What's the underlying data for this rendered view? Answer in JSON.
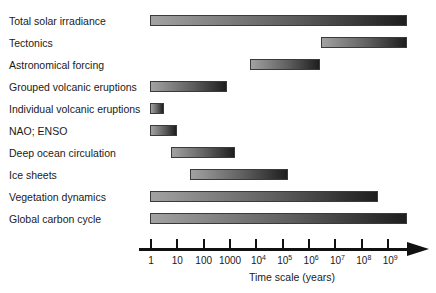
{
  "chart_data": {
    "type": "bar",
    "subtype": "horizontal range (Gantt-style) on log time axis",
    "title": "",
    "xlabel": "Time scale (years)",
    "ylabel": "",
    "x_scale": "log10",
    "xlim_log10": [
      0,
      9.7
    ],
    "grid": false,
    "legend": null,
    "x_ticks": [
      {
        "base": "1",
        "exp": ""
      },
      {
        "base": "10",
        "exp": ""
      },
      {
        "base": "100",
        "exp": ""
      },
      {
        "base": "1000",
        "exp": ""
      },
      {
        "base": "10",
        "exp": "4"
      },
      {
        "base": "10",
        "exp": "5"
      },
      {
        "base": "10",
        "exp": "6"
      },
      {
        "base": "10",
        "exp": "7"
      },
      {
        "base": "10",
        "exp": "8"
      },
      {
        "base": "10",
        "exp": "9"
      }
    ],
    "categories": [
      "Total solar irradiance",
      "Tectonics",
      "Astronomical forcing",
      "Grouped volcanic eruptions",
      "Individual volcanic eruptions",
      "NAO; ENSO",
      "Deep ocean circulation",
      "Ice sheets",
      "Vegetation dynamics",
      "Global carbon cycle"
    ],
    "ranges_log10_years": [
      {
        "start": 0.0,
        "end": 9.7
      },
      {
        "start": 6.5,
        "end": 9.7
      },
      {
        "start": 3.8,
        "end": 6.4
      },
      {
        "start": 0.0,
        "end": 2.9
      },
      {
        "start": 0.0,
        "end": 0.5
      },
      {
        "start": 0.0,
        "end": 1.0
      },
      {
        "start": 0.8,
        "end": 3.2
      },
      {
        "start": 1.5,
        "end": 5.2
      },
      {
        "start": 0.0,
        "end": 8.6
      },
      {
        "start": 0.0,
        "end": 9.7
      }
    ],
    "colors": {
      "bar_light": "#a2a2a2",
      "bar_dark": "#1e1e1e",
      "axis": "#111111",
      "text": "#1a1a1a"
    }
  },
  "layout": {
    "x0_px": 151,
    "px_per_decade": 26.35,
    "row_top0_px": 15,
    "row_spacing_px": 22
  }
}
